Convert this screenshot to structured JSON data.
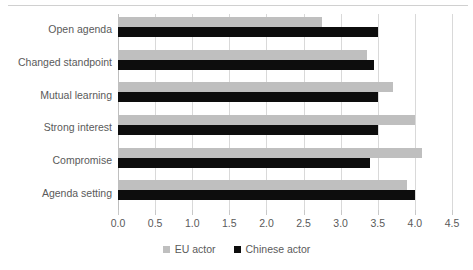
{
  "chart_data": {
    "type": "bar",
    "orientation": "horizontal",
    "title": "",
    "xlabel": "",
    "ylabel": "",
    "xlim": [
      0.0,
      4.5
    ],
    "xticks": [
      "0.0",
      "0.5",
      "1.0",
      "1.5",
      "2.0",
      "2.5",
      "3.0",
      "3.5",
      "4.0",
      "4.5"
    ],
    "xtick_values": [
      0.0,
      0.5,
      1.0,
      1.5,
      2.0,
      2.5,
      3.0,
      3.5,
      4.0,
      4.5
    ],
    "grid": true,
    "legend_position": "bottom",
    "categories": [
      "Open agenda",
      "Changed standpoint",
      "Mutual learning",
      "Strong interest",
      "Compromise",
      "Agenda setting"
    ],
    "series": [
      {
        "name": "EU actor",
        "color": "#bfbfbf",
        "values": [
          2.75,
          3.35,
          3.7,
          4.0,
          4.1,
          3.9
        ]
      },
      {
        "name": "Chinese actor",
        "color": "#0d0d0d",
        "values": [
          3.5,
          3.45,
          3.5,
          3.5,
          3.4,
          4.0
        ]
      }
    ]
  },
  "legend": {
    "entries": [
      {
        "label": "EU actor",
        "swatch": "eu-actor-swatch"
      },
      {
        "label": "Chinese actor",
        "swatch": "chinese-actor-swatch"
      }
    ]
  },
  "colors": {
    "eu_actor": "#bfbfbf",
    "chinese_actor": "#0d0d0d",
    "gridline": "#d9d9d9",
    "text": "#5a5a5a",
    "background": "#ffffff"
  }
}
